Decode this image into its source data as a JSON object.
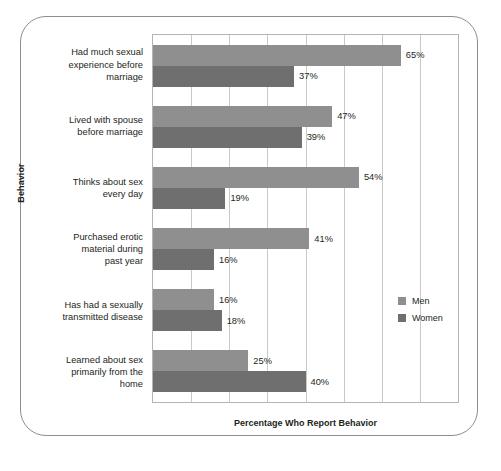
{
  "chart_data": {
    "type": "bar",
    "orientation": "horizontal",
    "title": "",
    "xlabel": "Percentage Who Report Behavior",
    "ylabel": "Behavior",
    "xlim": [
      0,
      80
    ],
    "grid": true,
    "gridline_values": [
      10,
      20,
      30,
      40,
      50,
      60,
      70
    ],
    "legend_position": "right-middle",
    "categories": [
      "Had much sexual experience before marriage",
      "Lived with spouse before marriage",
      "Thinks about sex every day",
      "Purchased erotic material during past year",
      "Has had a sexually transmitted disease",
      "Learned about sex primarily from the home"
    ],
    "series": [
      {
        "name": "Men",
        "color": "#8f8f8f",
        "values": [
          65,
          47,
          54,
          41,
          16,
          25
        ]
      },
      {
        "name": "Women",
        "color": "#6f6f6f",
        "values": [
          37,
          39,
          19,
          16,
          18,
          40
        ]
      }
    ],
    "value_labels": {
      "Men": [
        "65%",
        "47%",
        "54%",
        "41%",
        "16%",
        "25%"
      ],
      "Women": [
        "37%",
        "39%",
        "19%",
        "16%",
        "18%",
        "40%"
      ]
    }
  },
  "axes": {
    "y_title": "Behavior",
    "x_title": "Percentage Who Report Behavior"
  },
  "categories": [
    {
      "line1": "Had much sexual",
      "line2": "experience before",
      "line3": "marriage"
    },
    {
      "line1": "Lived with spouse",
      "line2": "before marriage",
      "line3": ""
    },
    {
      "line1": "Thinks about sex",
      "line2": "every day",
      "line3": ""
    },
    {
      "line1": "Purchased erotic",
      "line2": "material during",
      "line3": "past year"
    },
    {
      "line1": "Has had a sexually",
      "line2": "transmitted disease",
      "line3": ""
    },
    {
      "line1": "Learned about sex",
      "line2": "primarily from the",
      "line3": "home"
    }
  ],
  "bars": [
    {
      "men_label": "65%",
      "women_label": "37%"
    },
    {
      "men_label": "47%",
      "women_label": "39%"
    },
    {
      "men_label": "54%",
      "women_label": "19%"
    },
    {
      "men_label": "41%",
      "women_label": "16%"
    },
    {
      "men_label": "16%",
      "women_label": "18%"
    },
    {
      "men_label": "25%",
      "women_label": "40%"
    }
  ],
  "legend": {
    "items": [
      {
        "label": "Men",
        "color": "#8f8f8f"
      },
      {
        "label": "Women",
        "color": "#6f6f6f"
      }
    ]
  }
}
